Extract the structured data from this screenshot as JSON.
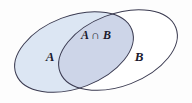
{
  "figure": {
    "type": "venn-diagram",
    "background_color": "#fdfdfd",
    "outline_color": "#3a3a50",
    "outline_width": 1
  },
  "sets": [
    {
      "id": "A",
      "label": "A",
      "fill_color": "#dce6f3",
      "label_x": 50,
      "label_y": 61,
      "font_size": 13,
      "ellipse": {
        "cx": 74,
        "cy": 52,
        "rx": 62,
        "ry": 36,
        "rotation": -21
      }
    },
    {
      "id": "B",
      "label": "B",
      "fill_color": "#ffffff",
      "label_x": 139,
      "label_y": 61,
      "font_size": 13,
      "ellipse": {
        "cx": 118,
        "cy": 50,
        "rx": 62,
        "ry": 36,
        "rotation": -21
      }
    }
  ],
  "regions": [
    {
      "id": "A-intersect-B",
      "label": "A ∩ B",
      "fill_color": "#cdd5e8",
      "label_x": 96,
      "label_y": 39,
      "font_size": 12
    }
  ]
}
